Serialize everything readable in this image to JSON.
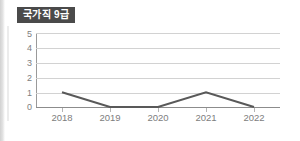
{
  "badge": {
    "label": "국가직 9급"
  },
  "colors": {
    "badge_background": "#4a4a4a",
    "badge_text": "#ffffff",
    "line": "#595959",
    "gridline": "#d2d2d2",
    "axis": "#8c8c8c",
    "tick_text": "#7d7d7d",
    "background": "#ffffff"
  },
  "chart_data": {
    "type": "line",
    "title": "국가직 9급",
    "xlabel": "",
    "ylabel": "",
    "categories": [
      "2018",
      "2019",
      "2020",
      "2021",
      "2022"
    ],
    "values": [
      1,
      0,
      0,
      1,
      0
    ],
    "series": [
      {
        "name": "국가직 9급",
        "values": [
          1,
          0,
          0,
          1,
          0
        ]
      }
    ],
    "ylim": [
      0,
      5
    ],
    "yticks": [
      0,
      1,
      2,
      3,
      4,
      5
    ],
    "ytick_labels": [
      "0",
      "1",
      "2",
      "3",
      "4",
      "5"
    ],
    "grid": true,
    "legend": false,
    "markers": false
  }
}
